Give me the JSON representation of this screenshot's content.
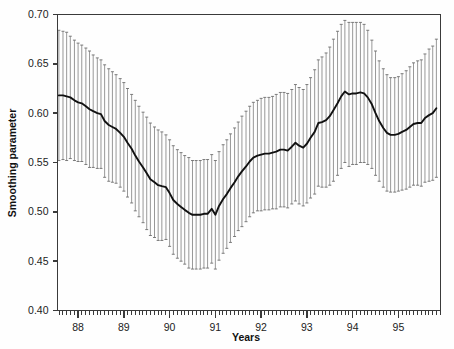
{
  "chart_data": {
    "type": "line",
    "title": "",
    "xlabel": "Years",
    "ylabel": "Smoothing parameter",
    "grid": false,
    "legend": null,
    "xlim": [
      87.55,
      95.92
    ],
    "ylim": [
      0.4,
      0.7
    ],
    "ytick_labels": [
      "0.40",
      "0.45",
      "0.50",
      "0.55",
      "0.60",
      "0.65",
      "0.70"
    ],
    "ytick_values": [
      0.4,
      0.45,
      0.5,
      0.55,
      0.6,
      0.65,
      0.7
    ],
    "xtick_labels": [
      "88",
      "89",
      "90",
      "91",
      "92",
      "93",
      "94",
      "95"
    ],
    "xtick_values": [
      88,
      89,
      90,
      91,
      92,
      93,
      94,
      95
    ],
    "x_minor_tick_interval": 0.0833,
    "series_name": "Smoothing parameter",
    "error_bar_style": "vertical line with caps",
    "x": [
      87.58,
      87.67,
      87.75,
      87.83,
      87.92,
      88.0,
      88.08,
      88.17,
      88.25,
      88.33,
      88.42,
      88.5,
      88.58,
      88.67,
      88.75,
      88.83,
      88.92,
      89.0,
      89.08,
      89.17,
      89.25,
      89.33,
      89.42,
      89.5,
      89.58,
      89.67,
      89.75,
      89.83,
      89.92,
      90.0,
      90.08,
      90.17,
      90.25,
      90.33,
      90.42,
      90.5,
      90.58,
      90.67,
      90.75,
      90.83,
      90.92,
      91.0,
      91.08,
      91.17,
      91.25,
      91.33,
      91.42,
      91.5,
      91.58,
      91.67,
      91.75,
      91.83,
      91.92,
      92.0,
      92.08,
      92.17,
      92.25,
      92.33,
      92.42,
      92.5,
      92.58,
      92.67,
      92.75,
      92.83,
      92.92,
      93.0,
      93.08,
      93.17,
      93.25,
      93.33,
      93.42,
      93.5,
      93.58,
      93.67,
      93.75,
      93.83,
      93.92,
      94.0,
      94.08,
      94.17,
      94.25,
      94.33,
      94.42,
      94.5,
      94.58,
      94.67,
      94.75,
      94.83,
      94.92,
      95.0,
      95.08,
      95.17,
      95.25,
      95.33,
      95.42,
      95.5,
      95.58,
      95.67,
      95.75,
      95.83
    ],
    "values": [
      0.618,
      0.618,
      0.617,
      0.616,
      0.613,
      0.611,
      0.61,
      0.607,
      0.604,
      0.602,
      0.6,
      0.599,
      0.592,
      0.588,
      0.586,
      0.584,
      0.58,
      0.576,
      0.57,
      0.564,
      0.557,
      0.551,
      0.545,
      0.539,
      0.533,
      0.53,
      0.527,
      0.526,
      0.525,
      0.519,
      0.512,
      0.508,
      0.505,
      0.502,
      0.499,
      0.497,
      0.497,
      0.497,
      0.498,
      0.498,
      0.503,
      0.497,
      0.506,
      0.513,
      0.518,
      0.524,
      0.53,
      0.536,
      0.541,
      0.546,
      0.551,
      0.555,
      0.557,
      0.558,
      0.559,
      0.559,
      0.56,
      0.561,
      0.563,
      0.563,
      0.562,
      0.566,
      0.57,
      0.567,
      0.565,
      0.569,
      0.575,
      0.581,
      0.59,
      0.591,
      0.593,
      0.597,
      0.603,
      0.61,
      0.617,
      0.622,
      0.619,
      0.62,
      0.62,
      0.621,
      0.62,
      0.616,
      0.609,
      0.6,
      0.592,
      0.585,
      0.58,
      0.578,
      0.578,
      0.579,
      0.581,
      0.583,
      0.586,
      0.589,
      0.59,
      0.59,
      0.595,
      0.598,
      0.6,
      0.605
    ],
    "upper": [
      0.684,
      0.683,
      0.682,
      0.678,
      0.674,
      0.671,
      0.669,
      0.666,
      0.663,
      0.659,
      0.656,
      0.654,
      0.649,
      0.645,
      0.642,
      0.639,
      0.635,
      0.631,
      0.625,
      0.619,
      0.613,
      0.607,
      0.601,
      0.596,
      0.59,
      0.586,
      0.583,
      0.581,
      0.578,
      0.573,
      0.567,
      0.563,
      0.56,
      0.557,
      0.555,
      0.552,
      0.552,
      0.552,
      0.553,
      0.553,
      0.558,
      0.552,
      0.561,
      0.568,
      0.573,
      0.579,
      0.585,
      0.591,
      0.597,
      0.602,
      0.607,
      0.611,
      0.613,
      0.615,
      0.616,
      0.616,
      0.617,
      0.619,
      0.621,
      0.621,
      0.62,
      0.624,
      0.629,
      0.626,
      0.624,
      0.629,
      0.636,
      0.644,
      0.654,
      0.657,
      0.661,
      0.667,
      0.675,
      0.683,
      0.69,
      0.694,
      0.692,
      0.692,
      0.692,
      0.692,
      0.69,
      0.684,
      0.674,
      0.663,
      0.653,
      0.645,
      0.639,
      0.636,
      0.636,
      0.637,
      0.64,
      0.643,
      0.647,
      0.651,
      0.653,
      0.654,
      0.66,
      0.665,
      0.668,
      0.675
    ],
    "lower": [
      0.552,
      0.553,
      0.552,
      0.554,
      0.552,
      0.551,
      0.551,
      0.548,
      0.545,
      0.545,
      0.544,
      0.544,
      0.535,
      0.531,
      0.53,
      0.529,
      0.525,
      0.521,
      0.515,
      0.509,
      0.501,
      0.495,
      0.489,
      0.482,
      0.476,
      0.474,
      0.471,
      0.471,
      0.472,
      0.465,
      0.457,
      0.453,
      0.45,
      0.447,
      0.443,
      0.442,
      0.442,
      0.442,
      0.443,
      0.443,
      0.448,
      0.442,
      0.451,
      0.458,
      0.463,
      0.469,
      0.475,
      0.481,
      0.485,
      0.49,
      0.495,
      0.499,
      0.501,
      0.501,
      0.502,
      0.502,
      0.503,
      0.503,
      0.505,
      0.505,
      0.504,
      0.508,
      0.511,
      0.508,
      0.506,
      0.509,
      0.514,
      0.518,
      0.526,
      0.525,
      0.525,
      0.527,
      0.531,
      0.537,
      0.544,
      0.55,
      0.546,
      0.548,
      0.548,
      0.55,
      0.55,
      0.548,
      0.544,
      0.537,
      0.531,
      0.525,
      0.521,
      0.52,
      0.52,
      0.521,
      0.522,
      0.523,
      0.525,
      0.527,
      0.527,
      0.526,
      0.53,
      0.531,
      0.532,
      0.535
    ]
  }
}
